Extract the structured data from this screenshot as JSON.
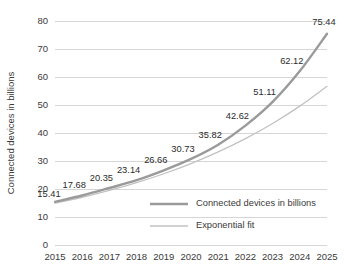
{
  "chart_data": {
    "type": "line",
    "title": "",
    "xlabel": "",
    "ylabel": "Connected devices in billions",
    "categories": [
      "2015",
      "2016",
      "2017",
      "2018",
      "2019",
      "2020",
      "2021",
      "2022",
      "2023",
      "2024",
      "2025"
    ],
    "x": [
      2015,
      2016,
      2017,
      2018,
      2019,
      2020,
      2021,
      2022,
      2023,
      2024,
      2025
    ],
    "ylim": [
      0,
      80
    ],
    "ytick_values": [
      0,
      10,
      20,
      30,
      40,
      50,
      60,
      70,
      80
    ],
    "ytick_labels": [
      "0",
      "10",
      "20",
      "30",
      "40",
      "50",
      "60",
      "70",
      "80"
    ],
    "grid": true,
    "legend_position": "center-right-inside",
    "series": [
      {
        "name": "Connected devices in billions",
        "color": "#9a9a9a",
        "width": 2.4,
        "values": [
          15.41,
          17.68,
          20.35,
          23.14,
          26.66,
          30.73,
          35.82,
          42.62,
          51.11,
          62.12,
          75.44
        ],
        "data_labels": [
          "15.41",
          "17.68",
          "20.35",
          "23.14",
          "26.66",
          "30.73",
          "35.82",
          "42.62",
          "51.11",
          "62.12",
          "75.44"
        ]
      },
      {
        "name": "Exponential fit",
        "color": "#c2c2c2",
        "width": 1.3,
        "values": [
          14.92,
          17.05,
          19.49,
          22.27,
          25.45,
          29.09,
          33.24,
          37.99,
          43.41,
          49.61,
          56.69
        ]
      }
    ]
  },
  "legend": {
    "items": [
      {
        "label": "Connected devices in billions",
        "color": "#9a9a9a",
        "width": 2.4
      },
      {
        "label": "Exponential fit",
        "color": "#c2c2c2",
        "width": 1.3
      }
    ]
  },
  "colors": {
    "background": "#ffffff",
    "gridline": "#d2d2d2",
    "text": "#3a3a3a",
    "series_primary": "#9a9a9a",
    "series_fit": "#c2c2c2"
  }
}
